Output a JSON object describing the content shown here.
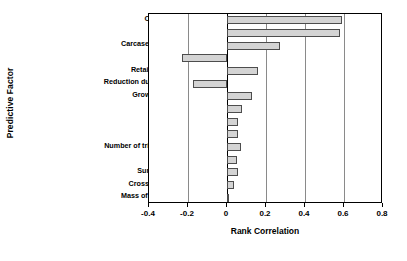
{
  "chart_data": {
    "type": "bar",
    "orientation": "horizontal",
    "title": "",
    "xlabel": "Rank Correlation",
    "ylabel": "Predictive Factor",
    "xlim": [
      -0.4,
      0.8
    ],
    "xticks": [
      -0.4,
      -0.2,
      0,
      0.2,
      0.4,
      0.6,
      0.8
    ],
    "xtick_labels": [
      "-0.4",
      "-0.2",
      "0",
      "0.2",
      "0.4",
      "0.6",
      "0.8"
    ],
    "grid": "vertical",
    "legend": "none",
    "bar_fill_color": "#d4d4d4",
    "bar_edge_color": "#4d4d4d",
    "categories": [
      "Concentration in feces",
      "Host susceptibility",
      "Carcase contamination factor",
      "Cooking preference",
      "Retail storage temperature",
      "Reduction due to decontamination",
      "Growth during processing",
      "Retail storage time",
      "Prevalence in feces",
      "Mass ingested",
      "Number of trimmings in a package",
      "Mass of a trimming",
      "Surface area of trimming",
      "Cross contamination factor",
      "Mass of ground beef package"
    ],
    "values": [
      0.59,
      0.58,
      0.27,
      -0.23,
      0.16,
      -0.175,
      0.13,
      0.075,
      0.055,
      0.055,
      0.07,
      0.05,
      0.055,
      0.035,
      0.012
    ]
  }
}
